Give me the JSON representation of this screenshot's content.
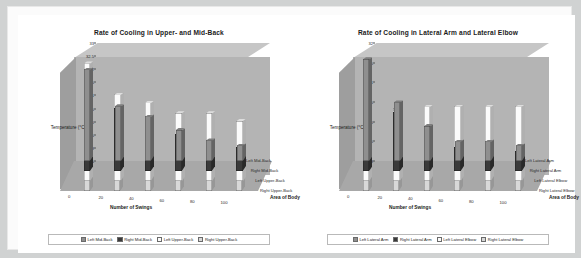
{
  "page": {
    "background_color": "#d0d2d2",
    "paper_color": "#ffffff"
  },
  "charts": [
    {
      "title": "Rate of Cooling in Upper- and Mid-Back",
      "ylabel": "Temperature (°C)",
      "xlabel": "Number of Swings",
      "zlabel": "Area of Body",
      "yticks": [
        "28.5",
        "29",
        "29.5",
        "30",
        "30.5",
        "31",
        "31.5",
        "32",
        "32.5",
        "33"
      ],
      "xticks": [
        "0",
        "20",
        "40",
        "60",
        "80",
        "100"
      ],
      "zticks": [
        "Left Mid-Back",
        "Right Mid-Back",
        "Left Upper-Back",
        "Right Upper-Back"
      ],
      "legend": [
        "Left Mid-Back",
        "Right Mid-Back",
        "Left Upper-Back",
        "Right Upper-Back"
      ]
    },
    {
      "title": "Rate of Cooling in Lateral Arm and Lateral Elbow",
      "ylabel": "Temperature (°C)",
      "xlabel": "Number of Swings",
      "zlabel": "Area of Body",
      "yticks": [
        "29",
        "29.5",
        "30",
        "30.5",
        "31",
        "31.5",
        "32"
      ],
      "xticks": [
        "0",
        "20",
        "40",
        "60",
        "80",
        "100"
      ],
      "zticks": [
        "Left Lateral Arm",
        "Right Lateral Arm",
        "Left Lateral Elbow",
        "Right Lateral Elbow"
      ],
      "legend": [
        "Left Lateral Arm",
        "Right Lateral Arm",
        "Left Lateral Elbow",
        "Right Lateral Elbow"
      ]
    }
  ],
  "chart_data": [
    {
      "type": "bar",
      "title": "Rate of Cooling in Upper- and Mid-Back",
      "xlabel": "Number of Swings",
      "ylabel": "Temperature (°C)",
      "zlabel": "Area of Body",
      "categories": [
        "0",
        "20",
        "40",
        "60",
        "80",
        "100"
      ],
      "ylim": [
        28.5,
        33.0
      ],
      "ytick_step": 0.5,
      "grid": false,
      "legend_position": "bottom",
      "projection": "3d-columns",
      "series": [
        {
          "name": "Left Mid-Back",
          "color": "#8f8f8f",
          "values": [
            32.0,
            30.6,
            30.2,
            29.7,
            29.3,
            29.1
          ]
        },
        {
          "name": "Right Mid-Back",
          "color": "#3a3a3a",
          "values": [
            32.2,
            30.9,
            30.4,
            29.9,
            29.6,
            29.4
          ]
        },
        {
          "name": "Left Upper-Back",
          "color": "#fbfbfb",
          "values": [
            33.0,
            31.8,
            31.5,
            31.1,
            31.1,
            30.8
          ]
        },
        {
          "name": "Right Upper-Back",
          "color": "#d8d8d8",
          "values": [
            33.0,
            31.9,
            31.6,
            31.2,
            31.2,
            30.9
          ]
        }
      ]
    },
    {
      "type": "bar",
      "title": "Rate of Cooling in Lateral Arm and Lateral Elbow",
      "xlabel": "Number of Swings",
      "ylabel": "Temperature (°C)",
      "zlabel": "Area of Body",
      "categories": [
        "0",
        "20",
        "40",
        "60",
        "80",
        "100"
      ],
      "ylim": [
        29.0,
        32.0
      ],
      "ytick_step": 0.5,
      "grid": false,
      "legend_position": "bottom",
      "projection": "3d-columns",
      "series": [
        {
          "name": "Left Lateral Arm",
          "color": "#8f8f8f",
          "values": [
            31.6,
            30.5,
            29.9,
            29.5,
            29.5,
            29.4
          ]
        },
        {
          "name": "Right Lateral Arm",
          "color": "#3a3a3a",
          "values": [
            31.5,
            30.5,
            29.9,
            29.6,
            29.6,
            29.5
          ]
        },
        {
          "name": "Left Lateral Elbow",
          "color": "#fbfbfb",
          "values": [
            31.3,
            30.8,
            30.9,
            30.9,
            30.9,
            30.9
          ]
        },
        {
          "name": "Right Lateral Elbow",
          "color": "#d8d8d8",
          "values": [
            31.8,
            31.1,
            31.0,
            31.0,
            31.0,
            31.0
          ]
        }
      ]
    }
  ]
}
